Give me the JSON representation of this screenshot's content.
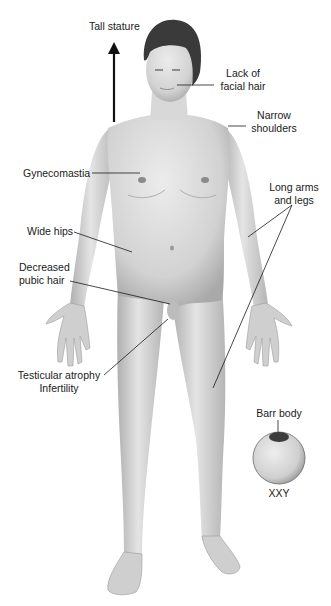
{
  "figure": {
    "labels": {
      "tall_stature": "Tall stature",
      "lack_facial_hair_1": "Lack of",
      "lack_facial_hair_2": "facial hair",
      "narrow_shoulders_1": "Narrow",
      "narrow_shoulders_2": "shoulders",
      "gynecomastia": "Gynecomastia",
      "long_limbs_1": "Long arms",
      "long_limbs_2": "and legs",
      "wide_hips": "Wide hips",
      "decreased_pubic_hair_1": "Decreased",
      "decreased_pubic_hair_2": "pubic hair",
      "testicular_atrophy": "Testicular atrophy",
      "infertility": "Infertility",
      "barr_body": "Barr body",
      "karyotype": "XXY"
    },
    "colors": {
      "skin": "#d4d4d4",
      "skin_shadow": "#a8a8a8",
      "hair": "#3a3a3a",
      "line": "#1a1a1a",
      "barr_body": "#3c3c3c"
    }
  }
}
